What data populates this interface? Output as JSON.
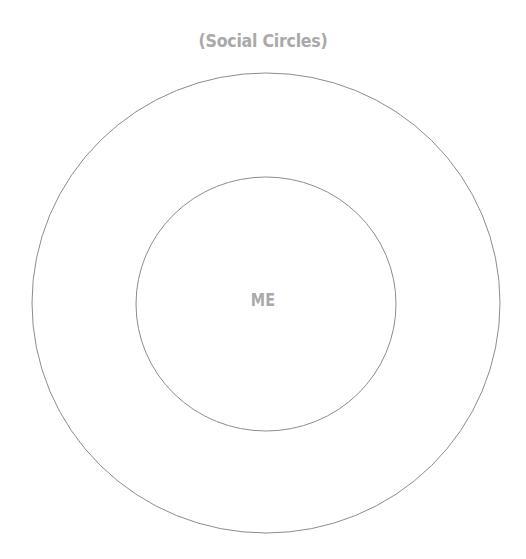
{
  "diagram": {
    "title": "(Social Circles)",
    "center_label": "ME",
    "colors": {
      "text": "#a9a9a9",
      "stroke": "#8c8c8c",
      "background": "#ffffff"
    },
    "circles": [
      {
        "name": "outer-circle",
        "cx": 266,
        "cy": 303,
        "rx": 234,
        "ry": 230
      },
      {
        "name": "inner-circle",
        "cx": 266,
        "cy": 304,
        "rx": 130,
        "ry": 127
      }
    ]
  }
}
